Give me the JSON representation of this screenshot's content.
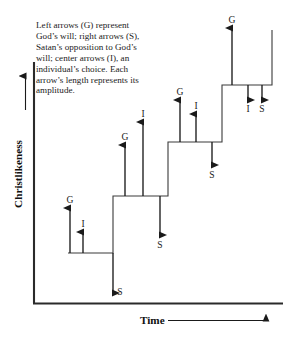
{
  "figure": {
    "caption": "Left arrows (G) represent God’s will; right arrows (S), Satan’s opposition to God’s will; center arrows (I), an individual’s choice. Each arrow’s length represents its amplitude.",
    "y_axis_label": "Christlikeness",
    "x_axis_label": "Time",
    "ink_color": "#1a1a1a",
    "background_color": "#ffffff"
  },
  "chart_data": {
    "type": "line",
    "title": "",
    "xlabel": "Time",
    "ylabel": "Christlikeness",
    "grid": false,
    "legend": "none",
    "axis_style": "arrowed, unlabeled ticks",
    "steps": [
      {
        "index": 1,
        "level": 1,
        "x_start": 68,
        "x_end": 113,
        "y": 253
      },
      {
        "index": 2,
        "level": 2,
        "x_start": 113,
        "x_end": 168,
        "y": 196
      },
      {
        "index": 3,
        "level": 3,
        "x_start": 168,
        "x_end": 222,
        "y": 142
      },
      {
        "index": 4,
        "level": 4,
        "x_start": 222,
        "x_end": 272,
        "y": 85
      }
    ],
    "arrow_groups": [
      {
        "step": 1,
        "arrows": [
          {
            "label": "G",
            "meaning": "God’s will",
            "direction": "up",
            "x": 70,
            "base_y": 253,
            "tip_y": 208,
            "length": 45
          },
          {
            "label": "I",
            "meaning": "individual’s choice",
            "direction": "up",
            "x": 83,
            "base_y": 253,
            "tip_y": 232,
            "length": 21
          },
          {
            "label": "S",
            "meaning": "Satan’s opposition",
            "direction": "down",
            "x": 113,
            "base_y": 253,
            "tip_y": 293,
            "length": 40
          }
        ]
      },
      {
        "step": 2,
        "arrows": [
          {
            "label": "G",
            "meaning": "God’s will",
            "direction": "up",
            "x": 125,
            "base_y": 196,
            "tip_y": 145,
            "length": 51
          },
          {
            "label": "I",
            "meaning": "individual’s choice",
            "direction": "up",
            "x": 143,
            "base_y": 196,
            "tip_y": 122,
            "length": 74
          },
          {
            "label": "S",
            "meaning": "Satan’s opposition",
            "direction": "down",
            "x": 160,
            "base_y": 196,
            "tip_y": 235,
            "length": 39
          }
        ]
      },
      {
        "step": 3,
        "arrows": [
          {
            "label": "G",
            "meaning": "God’s will",
            "direction": "up",
            "x": 180,
            "base_y": 142,
            "tip_y": 100,
            "length": 42
          },
          {
            "label": "I",
            "meaning": "individual’s choice",
            "direction": "up",
            "x": 196,
            "base_y": 142,
            "tip_y": 114,
            "length": 28
          },
          {
            "label": "S",
            "meaning": "Satan’s opposition",
            "direction": "down",
            "x": 212,
            "base_y": 142,
            "tip_y": 165,
            "length": 23
          }
        ]
      },
      {
        "step": 4,
        "arrows": [
          {
            "label": "G",
            "meaning": "God’s will",
            "direction": "up",
            "x": 232,
            "base_y": 85,
            "tip_y": 28,
            "length": 57
          },
          {
            "label": "I",
            "meaning": "individual’s choice",
            "direction": "down",
            "x": 248,
            "base_y": 85,
            "tip_y": 100,
            "length": 15
          },
          {
            "label": "S",
            "meaning": "Satan’s opposition",
            "direction": "down",
            "x": 262,
            "base_y": 85,
            "tip_y": 100,
            "length": 15
          }
        ]
      }
    ],
    "arrow_labels": [
      {
        "text": "G",
        "x": 70,
        "y": 194
      },
      {
        "text": "I",
        "x": 83,
        "y": 218
      },
      {
        "text": "S",
        "x": 120,
        "y": 286
      },
      {
        "text": "G",
        "x": 125,
        "y": 131
      },
      {
        "text": "I",
        "x": 143,
        "y": 108
      },
      {
        "text": "S",
        "x": 160,
        "y": 239
      },
      {
        "text": "G",
        "x": 180,
        "y": 86
      },
      {
        "text": "I",
        "x": 196,
        "y": 100
      },
      {
        "text": "S",
        "x": 212,
        "y": 169
      },
      {
        "text": "G",
        "x": 232,
        "y": 14
      },
      {
        "text": "I",
        "x": 248,
        "y": 103
      },
      {
        "text": "S",
        "x": 262,
        "y": 103
      }
    ]
  }
}
